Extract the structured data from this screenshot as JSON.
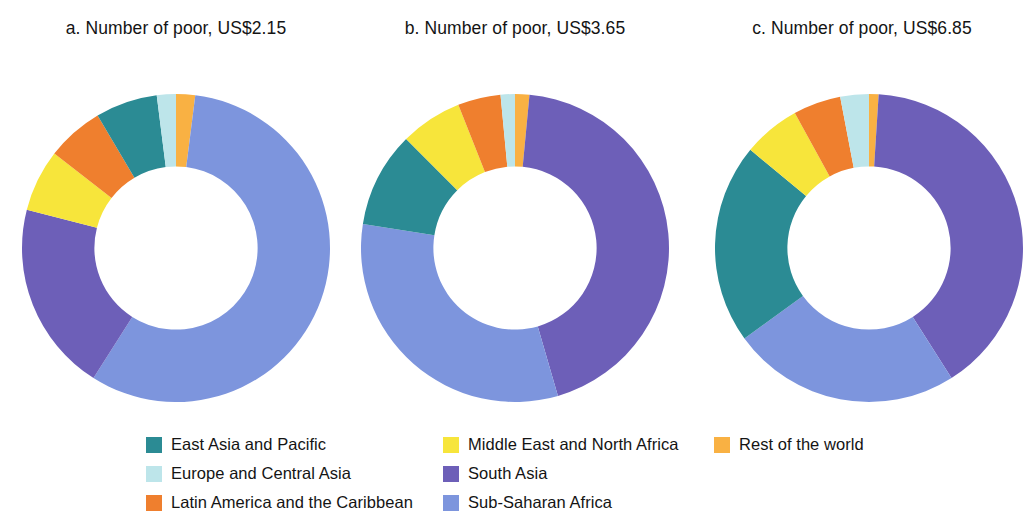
{
  "figure": {
    "background": "#ffffff",
    "panels": [
      {
        "id": "a",
        "title": "a. Number of poor, US$2.15"
      },
      {
        "id": "b",
        "title": "b. Number of poor, US$3.65"
      },
      {
        "id": "c",
        "title": "c. Number of poor, US$6.85"
      }
    ]
  },
  "legend": {
    "columns": [
      {
        "items": [
          {
            "label": "East Asia and Pacific",
            "color": "#2b8b94"
          },
          {
            "label": "Europe and Central Asia",
            "color": "#bde5ea"
          },
          {
            "label": "Latin America and the Caribbean",
            "color": "#ef7f2e"
          }
        ]
      },
      {
        "items": [
          {
            "label": "Middle East and North Africa",
            "color": "#f7e53b"
          },
          {
            "label": "South Asia",
            "color": "#6d5fb8"
          },
          {
            "label": "Sub-Saharan Africa",
            "color": "#7d95dd"
          }
        ]
      },
      {
        "items": [
          {
            "label": "Rest of the world",
            "color": "#f9b143"
          }
        ]
      }
    ]
  },
  "colors": {
    "east_asia_and_pacific": "#2b8b94",
    "europe_and_central_asia": "#bde5ea",
    "latin_america_and_the_caribbean": "#ef7f2e",
    "middle_east_and_north_africa": "#f7e53b",
    "south_asia": "#6d5fb8",
    "sub_saharan_africa": "#7d95dd",
    "rest_of_the_world": "#f9b143"
  },
  "chart_data": [
    {
      "type": "pie",
      "variant": "donut",
      "panel": "a",
      "title": "a. Number of poor, US$2.15",
      "start_angle_deg": 0,
      "direction": "clockwise",
      "inner_radius_ratio": 0.53,
      "units": "percent of total poor",
      "categories": [
        "Rest of the world",
        "Sub-Saharan Africa",
        "South Asia",
        "Middle East and North Africa",
        "Latin America and the Caribbean",
        "East Asia and Pacific",
        "Europe and Central Asia"
      ],
      "values": [
        2,
        57,
        20,
        6.5,
        6,
        6.5,
        2
      ],
      "colors": [
        "#f9b143",
        "#7d95dd",
        "#6d5fb8",
        "#f7e53b",
        "#ef7f2e",
        "#2b8b94",
        "#bde5ea"
      ]
    },
    {
      "type": "pie",
      "variant": "donut",
      "panel": "b",
      "title": "b. Number of poor, US$3.65",
      "start_angle_deg": 0,
      "direction": "clockwise",
      "inner_radius_ratio": 0.53,
      "units": "percent of total poor",
      "categories": [
        "Rest of the world",
        "South Asia",
        "Sub-Saharan Africa",
        "East Asia and Pacific",
        "Middle East and North Africa",
        "Latin America and the Caribbean",
        "Europe and Central Asia"
      ],
      "values": [
        1.5,
        44,
        32,
        10,
        6.5,
        4.5,
        1.5
      ],
      "colors": [
        "#f9b143",
        "#6d5fb8",
        "#7d95dd",
        "#2b8b94",
        "#f7e53b",
        "#ef7f2e",
        "#bde5ea"
      ]
    },
    {
      "type": "pie",
      "variant": "donut",
      "panel": "c",
      "title": "c. Number of poor, US$6.85",
      "start_angle_deg": 0,
      "direction": "clockwise",
      "inner_radius_ratio": 0.53,
      "units": "percent of total poor",
      "categories": [
        "Rest of the world",
        "South Asia",
        "Sub-Saharan Africa",
        "East Asia and Pacific",
        "Middle East and North Africa",
        "Latin America and the Caribbean",
        "Europe and Central Asia"
      ],
      "values": [
        1,
        40,
        24,
        21,
        6,
        5,
        3
      ],
      "colors": [
        "#f9b143",
        "#6d5fb8",
        "#7d95dd",
        "#2b8b94",
        "#f7e53b",
        "#ef7f2e",
        "#bde5ea"
      ]
    }
  ]
}
